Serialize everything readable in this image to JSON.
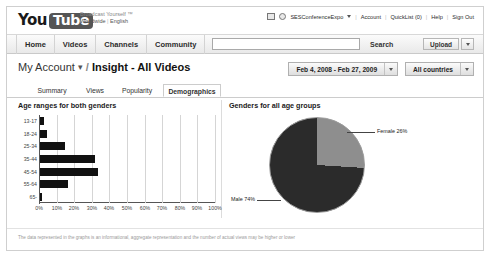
{
  "header": {
    "logo_you": "You",
    "logo_tube": "Tube",
    "slogan_line1": "Broadcast Yourself ™",
    "slogan_line2": "Worldwide",
    "slogan_sep": "|",
    "slogan_lang": "English",
    "account_name": "SESConferenceExpo",
    "links": [
      {
        "label": "Account"
      },
      {
        "label": "QuickList (0)"
      },
      {
        "label": "Help"
      },
      {
        "label": "Sign Out"
      }
    ]
  },
  "nav": {
    "tabs": [
      {
        "label": "Home"
      },
      {
        "label": "Videos"
      },
      {
        "label": "Channels"
      },
      {
        "label": "Community"
      }
    ],
    "search_value": "",
    "search_placeholder": "",
    "search_button": "Search",
    "upload_button": "Upload"
  },
  "title": {
    "account_crumb": "My Account",
    "separator": "/",
    "current": "Insight - All Videos"
  },
  "filters": {
    "date_range": "Feb 4, 2008 - Feb 27, 2009",
    "country": "All countries"
  },
  "subtabs": [
    {
      "label": "Summary",
      "active": false
    },
    {
      "label": "Views",
      "active": false
    },
    {
      "label": "Popularity",
      "active": false
    },
    {
      "label": "Demographics",
      "active": true
    }
  ],
  "footer": {
    "note": "The data represented in the graphs is an informational, aggregate representation and the number of actual views may be higher or lower"
  },
  "chart_data": [
    {
      "type": "bar",
      "title": "Age ranges for both genders",
      "orientation": "horizontal",
      "categories": [
        "13-17",
        "18-24",
        "25-34",
        "35-44",
        "45-54",
        "55-64",
        "65-"
      ],
      "values": [
        2,
        4,
        14,
        31,
        33,
        16,
        1
      ],
      "xlabel": "",
      "ylabel": "",
      "xlim": [
        0,
        100
      ],
      "xticks": [
        "0%",
        "10%",
        "20%",
        "30%",
        "40%",
        "50%",
        "60%",
        "70%",
        "80%",
        "90%",
        "100%"
      ],
      "grid": true,
      "bar_color": "#111111"
    },
    {
      "type": "pie",
      "title": "Genders for all age groups",
      "labels": [
        "Male",
        "Female"
      ],
      "values": [
        74,
        26
      ],
      "slice_labels": [
        "Male 74%",
        "Female 26%"
      ],
      "colors": [
        "#2b2b2b",
        "#8e8e8e"
      ],
      "legend": "callout-labels"
    }
  ]
}
